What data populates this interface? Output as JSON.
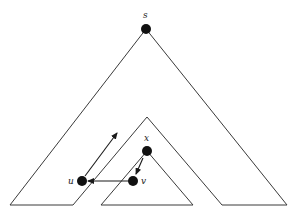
{
  "diagram": {
    "type": "tree-subtree-illustration",
    "nodes": {
      "s": {
        "label": "s",
        "x": 146,
        "y": 29
      },
      "x": {
        "label": "x",
        "x": 147,
        "y": 151
      },
      "u": {
        "label": "u",
        "x": 82,
        "y": 181
      },
      "v": {
        "label": "v",
        "x": 133,
        "y": 181
      }
    },
    "edges": [
      {
        "from": "x",
        "to": "v",
        "style": "arrow"
      },
      {
        "from": "v",
        "to": "u",
        "style": "arrow"
      },
      {
        "from": "u",
        "to": "up-right",
        "style": "arrow"
      }
    ],
    "colors": {
      "line": "#3a3a3a",
      "node": "#111111",
      "background": "#ffffff"
    }
  }
}
